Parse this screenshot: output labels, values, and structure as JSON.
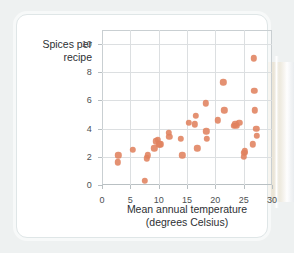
{
  "figure": {
    "card_background": "#ffffff",
    "page_background": "#eef1f1",
    "marker_color": "#e0825f",
    "grid_color": "#dcdfe1",
    "axis_color": "#c9cfd2"
  },
  "chart_data": {
    "type": "scatter",
    "title": "",
    "xlabel_line1": "Mean annual temperature",
    "xlabel_line2": "(degrees Celsius)",
    "ylabel_line1": "Spices per",
    "ylabel_line2": "recipe",
    "xlim": [
      0,
      30
    ],
    "ylim": [
      0,
      11
    ],
    "xticks": [
      0,
      5,
      10,
      15,
      20,
      25,
      30
    ],
    "yticks": [
      0,
      2,
      4,
      6,
      8,
      10
    ],
    "xtick_labels": [
      "0",
      "5",
      "10",
      "15",
      "20",
      "25",
      "30"
    ],
    "ytick_labels": [
      "0",
      "2",
      "4",
      "6",
      "8",
      "10"
    ],
    "grid": true,
    "legend": "none",
    "series_name": "Spices per recipe vs mean annual temperature",
    "n_points": 38,
    "points": [
      {
        "x": 2.8,
        "y": 1.6
      },
      {
        "x": 2.9,
        "y": 2.1
      },
      {
        "x": 5.4,
        "y": 2.5
      },
      {
        "x": 7.6,
        "y": 0.3
      },
      {
        "x": 7.9,
        "y": 1.9
      },
      {
        "x": 8.1,
        "y": 2.1
      },
      {
        "x": 9.2,
        "y": 2.6
      },
      {
        "x": 9.5,
        "y": 3.1
      },
      {
        "x": 9.8,
        "y": 3.2
      },
      {
        "x": 10.1,
        "y": 2.9
      },
      {
        "x": 10.3,
        "y": 2.9
      },
      {
        "x": 11.8,
        "y": 3.7
      },
      {
        "x": 11.9,
        "y": 3.4
      },
      {
        "x": 13.9,
        "y": 3.3
      },
      {
        "x": 14.2,
        "y": 2.1
      },
      {
        "x": 15.3,
        "y": 4.4
      },
      {
        "x": 16.4,
        "y": 4.3
      },
      {
        "x": 16.6,
        "y": 4.9
      },
      {
        "x": 16.8,
        "y": 2.6
      },
      {
        "x": 18.3,
        "y": 5.8
      },
      {
        "x": 18.4,
        "y": 3.8
      },
      {
        "x": 18.5,
        "y": 3.3
      },
      {
        "x": 20.4,
        "y": 4.6
      },
      {
        "x": 21.4,
        "y": 7.3
      },
      {
        "x": 21.6,
        "y": 5.3
      },
      {
        "x": 23.3,
        "y": 4.2
      },
      {
        "x": 23.5,
        "y": 4.3
      },
      {
        "x": 23.7,
        "y": 4.2
      },
      {
        "x": 24.2,
        "y": 4.4
      },
      {
        "x": 25.0,
        "y": 2.0
      },
      {
        "x": 25.1,
        "y": 2.3
      },
      {
        "x": 25.2,
        "y": 2.4
      },
      {
        "x": 26.6,
        "y": 2.9
      },
      {
        "x": 26.8,
        "y": 9.0
      },
      {
        "x": 26.9,
        "y": 6.7
      },
      {
        "x": 27.0,
        "y": 5.3
      },
      {
        "x": 27.2,
        "y": 4.0
      },
      {
        "x": 27.3,
        "y": 3.5
      }
    ]
  }
}
